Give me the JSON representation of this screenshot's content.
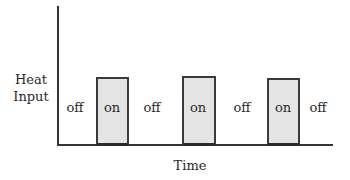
{
  "diagram": {
    "y_axis_label_line1": "Heat",
    "y_axis_label_line2": "Input",
    "x_axis_label": "Time",
    "segments": [
      {
        "state": "off",
        "label": "off"
      },
      {
        "state": "on",
        "label": "on"
      },
      {
        "state": "off",
        "label": "off"
      },
      {
        "state": "on",
        "label": "on"
      },
      {
        "state": "off",
        "label": "off"
      },
      {
        "state": "on",
        "label": "on"
      },
      {
        "state": "off",
        "label": "off"
      }
    ],
    "colors": {
      "axis": "#333333",
      "pulse_fill": "#e4e4e4",
      "pulse_border": "#3a3a3a",
      "text": "#2a2a2a"
    }
  }
}
